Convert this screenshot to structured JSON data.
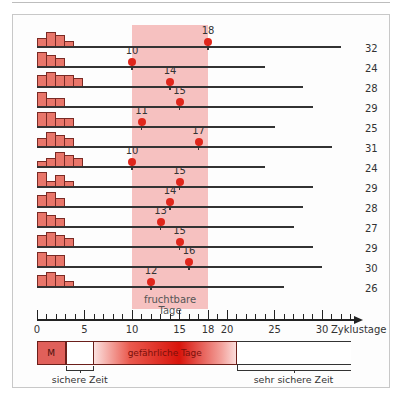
{
  "chart_data": {
    "type": "diagram",
    "title": "",
    "xlabel": "Zyklustage",
    "axis_ticks": [
      0,
      5,
      10,
      15,
      18,
      20,
      25,
      30
    ],
    "axis_range": [
      0,
      33
    ],
    "fertile_window": {
      "label": "fruchtbare Tage",
      "start_day": 10,
      "end_day": 18,
      "color": "#f6c1c0"
    },
    "cycles": [
      {
        "length": 32,
        "ovulation_day": 18,
        "histogram": [
          2,
          4,
          3,
          1
        ]
      },
      {
        "length": 24,
        "ovulation_day": 10,
        "histogram": [
          4,
          3,
          2
        ]
      },
      {
        "length": 28,
        "ovulation_day": 14,
        "histogram": [
          3,
          4,
          3,
          3,
          2
        ]
      },
      {
        "length": 29,
        "ovulation_day": 15,
        "histogram": [
          4,
          2,
          2
        ]
      },
      {
        "length": 25,
        "ovulation_day": 11,
        "histogram": [
          4,
          4,
          2,
          2
        ]
      },
      {
        "length": 31,
        "ovulation_day": 17,
        "histogram": [
          2,
          4,
          3,
          2
        ]
      },
      {
        "length": 24,
        "ovulation_day": 10,
        "histogram": [
          1,
          2,
          4,
          3,
          2
        ]
      },
      {
        "length": 29,
        "ovulation_day": 15,
        "histogram": [
          4,
          1,
          3,
          1
        ]
      },
      {
        "length": 28,
        "ovulation_day": 14,
        "histogram": [
          3,
          4,
          2
        ]
      },
      {
        "length": 27,
        "ovulation_day": 13,
        "histogram": [
          4,
          3,
          2
        ]
      },
      {
        "length": 29,
        "ovulation_day": 15,
        "histogram": [
          3,
          4,
          3,
          2
        ]
      },
      {
        "length": 30,
        "ovulation_day": 16,
        "histogram": [
          4,
          3,
          3
        ]
      },
      {
        "length": 26,
        "ovulation_day": 12,
        "histogram": [
          3,
          4,
          3,
          1
        ]
      }
    ],
    "phases": [
      {
        "label": "M",
        "start_day": 0,
        "end_day": 3,
        "color": "#e0605a"
      },
      {
        "label": "",
        "start_day": 3,
        "end_day": 6,
        "color": "#ffffff"
      },
      {
        "label": "gefährliche Tage",
        "start_day": 6,
        "end_day": 21,
        "color": "#e0261b"
      },
      {
        "label": "",
        "start_day": 21,
        "end_day": 33,
        "color": "#ffffff"
      }
    ],
    "annotations": [
      {
        "label": "sichere Zeit",
        "start_day": 3,
        "end_day": 6
      },
      {
        "label": "sehr sichere Zeit",
        "start_day": 21,
        "end_day": 33
      }
    ]
  },
  "labels": {
    "fertile": "fruchtbare Tage",
    "axis_unit": "Zyklustage",
    "menstruation": "M",
    "dangerous": "gefährliche Tage",
    "safe": "sichere Zeit",
    "very_safe": "sehr sichere Zeit"
  }
}
